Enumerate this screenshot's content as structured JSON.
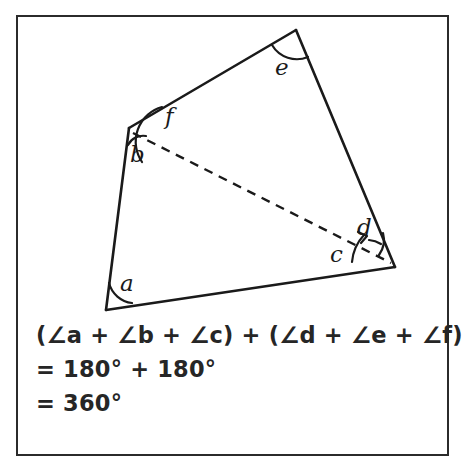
{
  "figure": {
    "type": "geometry-diagram",
    "shape": "quadrilateral divided by a dashed diagonal into two triangles",
    "stroke_color": "#1a1a1a",
    "frame_color": "#2b2b2b",
    "background": "#ffffff",
    "vertices": [
      {
        "name": "bottom-left",
        "x": 106,
        "y": 310
      },
      {
        "name": "upper-left",
        "x": 129,
        "y": 128
      },
      {
        "name": "top",
        "x": 296,
        "y": 30
      },
      {
        "name": "right",
        "x": 395,
        "y": 267
      }
    ],
    "diagonal": {
      "from": "upper-left",
      "to": "right",
      "style": "dashed"
    },
    "angle_labels": [
      {
        "id": "a",
        "text": "a",
        "x": 120,
        "y": 272,
        "vertex": "bottom-left"
      },
      {
        "id": "b",
        "text": "b",
        "x": 130,
        "y": 143,
        "vertex": "upper-left"
      },
      {
        "id": "c",
        "text": "c",
        "x": 330,
        "y": 243,
        "vertex": "right"
      },
      {
        "id": "d",
        "text": "d",
        "x": 357,
        "y": 216,
        "vertex": "right"
      },
      {
        "id": "e",
        "text": "e",
        "x": 275,
        "y": 56,
        "vertex": "top"
      },
      {
        "id": "f",
        "text": "f",
        "x": 165,
        "y": 105,
        "vertex": "upper-left"
      }
    ]
  },
  "equation": {
    "lines": [
      "(∠a + ∠b + ∠c) + (∠d + ∠e + ∠f)",
      "= 180° + 180°",
      "= 360°"
    ]
  }
}
